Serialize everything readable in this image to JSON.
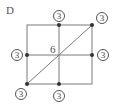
{
  "panel": {
    "label": "D"
  },
  "grid": {
    "rows": 2,
    "cols": 2,
    "line_color": "#777777",
    "node_color": "#333333",
    "diagonal": "bottom-left to top-right"
  },
  "center_value": "6",
  "node_labels": {
    "top_middle": "3",
    "top_right": "3",
    "middle_left": "3",
    "middle_right": "3",
    "bottom_left": "3",
    "bottom_middle": "3"
  }
}
